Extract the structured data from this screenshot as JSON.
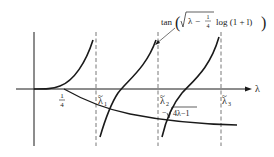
{
  "diagram": {
    "axis_label_x": "λ",
    "tick_quarter": {
      "num": "1",
      "den": "4"
    },
    "lambda_labels": [
      {
        "sym": "λ",
        "sub": "1"
      },
      {
        "sym": "λ",
        "sub": "2"
      },
      {
        "sym": "λ",
        "sub": "3"
      }
    ],
    "tan_label": {
      "prefix": "tan",
      "lambda": "λ",
      "minus": "−",
      "frac_num": "1",
      "frac_den": "4",
      "suffix": "log (1 + l)"
    },
    "sqrt_label": {
      "minus": "−",
      "body": "4λ−1"
    },
    "colors": {
      "ink": "#1a1a1a",
      "dashed": "#555555",
      "background": "#ffffff"
    }
  }
}
